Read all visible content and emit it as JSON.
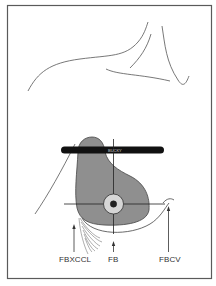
{
  "diagram": {
    "title": "",
    "bucky_label": "BUCKY",
    "labels": [
      {
        "id": "fbxccl",
        "text": "FBXCCL",
        "x": 60,
        "y": 256
      },
      {
        "id": "fb",
        "text": "FB",
        "x": 108,
        "y": 256
      },
      {
        "id": "fbcv",
        "text": "FBCV",
        "x": 160,
        "y": 256
      }
    ],
    "colors": {
      "frame": "#555555",
      "line": "#444444",
      "breast_fill": "#8f8f8f",
      "bucky": "#111111",
      "target_ring": "#d6d6d6",
      "target_center": "#222222"
    }
  }
}
